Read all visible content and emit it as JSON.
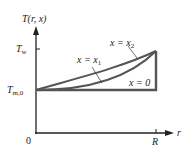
{
  "diagram": {
    "y_axis_label": "T(r, x)",
    "x_axis_label": "r",
    "origin_label": "0",
    "x_tick_label": "R",
    "y_tick_top": {
      "main": "T",
      "sub": "w"
    },
    "y_tick_bottom": {
      "main": "T",
      "sub": "m,0"
    },
    "curves": [
      {
        "name": "x = 0",
        "label_main": "x = 0",
        "description": "flat profile at T_m,0 with jump to T_w at r = R"
      },
      {
        "name": "x = x1",
        "label_main": "x = x",
        "label_sub": "1",
        "description": "lower curve rising from T_m,0 at r=0 to T_w at r=R"
      },
      {
        "name": "x = x2",
        "label_main": "x = x",
        "label_sub": "2",
        "description": "upper curve rising from T_m,0 at r=0 to T_w at r=R"
      }
    ],
    "colors": {
      "axis": "#222222",
      "curve": "#555555"
    }
  }
}
